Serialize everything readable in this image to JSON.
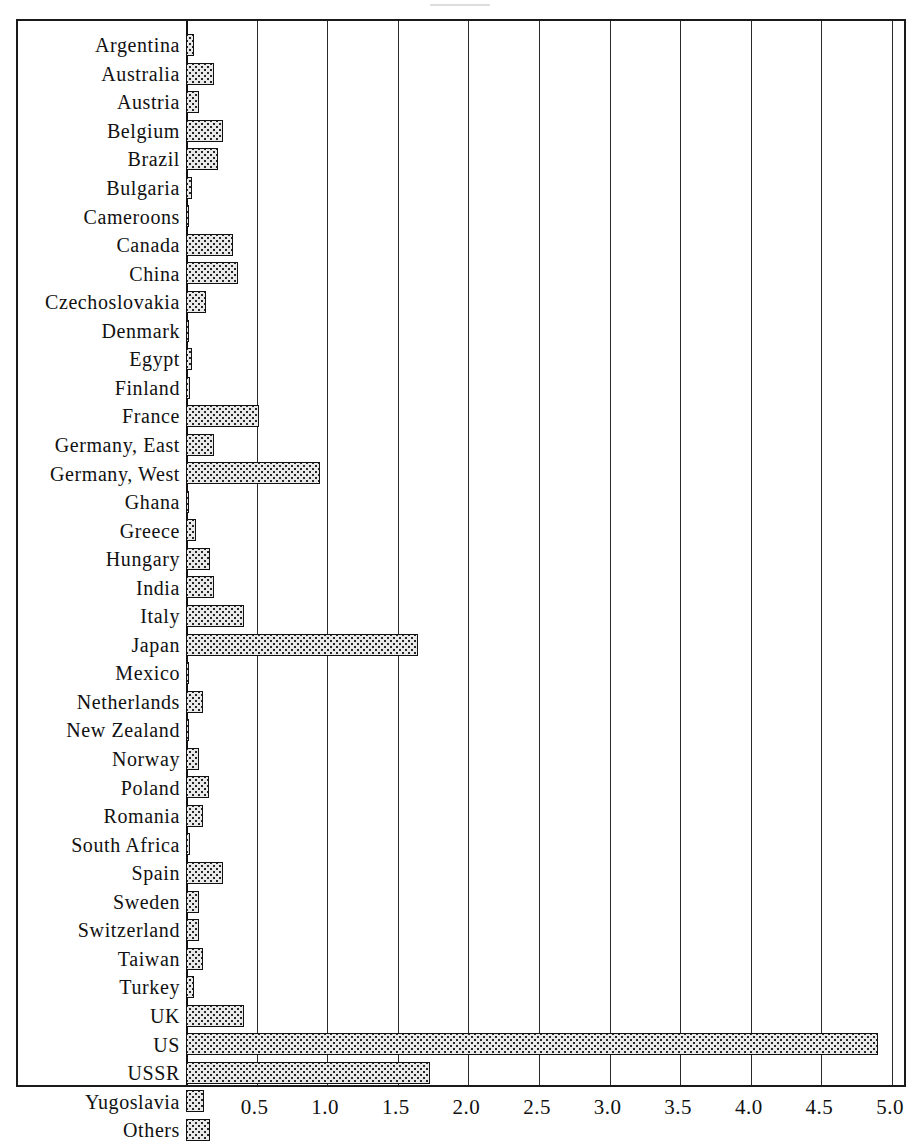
{
  "chart_data": {
    "type": "bar",
    "orientation": "horizontal",
    "title": "",
    "subtitle": "",
    "xlabel": "",
    "ylabel": "",
    "xlim": [
      0,
      5.0
    ],
    "grid": true,
    "legend": null,
    "xticks": [
      "0.5",
      "1.0",
      "1.5",
      "2.0",
      "2.5",
      "3.0",
      "3.5",
      "4.0",
      "4.5",
      "5.0"
    ],
    "xtick_values": [
      0.5,
      1.0,
      1.5,
      2.0,
      2.5,
      3.0,
      3.5,
      4.0,
      4.5,
      5.0
    ],
    "categories": [
      "Argentina",
      "Australia",
      "Austria",
      "Belgium",
      "Brazil",
      "Bulgaria",
      "Cameroons",
      "Canada",
      "China",
      "Czechoslovakia",
      "Denmark",
      "Egypt",
      "Finland",
      "France",
      "Germany, East",
      "Germany, West",
      "Ghana",
      "Greece",
      "Hungary",
      "India",
      "Italy",
      "Japan",
      "Mexico",
      "Netherlands",
      "New Zealand",
      "Norway",
      "Poland",
      "Romania",
      "South Africa",
      "Spain",
      "Sweden",
      "Switzerland",
      "Taiwan",
      "Turkey",
      "UK",
      "US",
      "USSR",
      "Yugoslavia",
      "Others"
    ],
    "values": [
      0.06,
      0.2,
      0.09,
      0.26,
      0.23,
      0.04,
      0.015,
      0.33,
      0.37,
      0.14,
      0.0,
      0.04,
      0.03,
      0.52,
      0.2,
      0.95,
      0.0,
      0.07,
      0.17,
      0.2,
      0.41,
      1.64,
      0.02,
      0.12,
      0.02,
      0.09,
      0.16,
      0.12,
      0.03,
      0.26,
      0.09,
      0.09,
      0.12,
      0.06,
      0.41,
      4.9,
      1.73,
      0.13,
      0.17
    ],
    "series": [
      {
        "name": "value",
        "values": [
          0.06,
          0.2,
          0.09,
          0.26,
          0.23,
          0.04,
          0.015,
          0.33,
          0.37,
          0.14,
          0.0,
          0.04,
          0.03,
          0.52,
          0.2,
          0.95,
          0.0,
          0.07,
          0.17,
          0.2,
          0.41,
          1.64,
          0.02,
          0.12,
          0.02,
          0.09,
          0.16,
          0.12,
          0.03,
          0.26,
          0.09,
          0.09,
          0.12,
          0.06,
          0.41,
          4.9,
          1.73,
          0.13,
          0.17
        ]
      }
    ]
  },
  "style": {
    "bar_fill": "#e9e9e9",
    "bar_pattern": "#262626",
    "bar_border": "#111111",
    "frame": "#1a1a1a",
    "gridline": "#2a2a2a",
    "background": "#ffffff",
    "text": "#111111"
  }
}
